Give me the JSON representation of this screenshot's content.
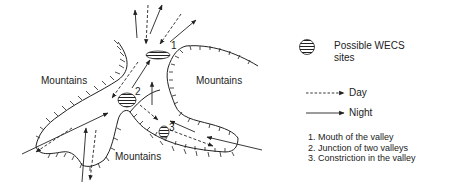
{
  "diagram": {
    "regions": [
      {
        "label": "Mountains",
        "position": "left"
      },
      {
        "label": "Mountains",
        "position": "right"
      },
      {
        "label": "Mountains",
        "position": "bottom"
      }
    ],
    "sites": [
      {
        "number": "1"
      },
      {
        "number": "2"
      },
      {
        "number": "3"
      }
    ]
  },
  "legend": {
    "site_label_line1": "Possible WECS",
    "site_label_line2": "sites",
    "day_label": "Day",
    "night_label": "Night",
    "notes": [
      "1. Mouth of the valley",
      "2. Junction of two valleys",
      "3. Constriction in the valley"
    ]
  }
}
